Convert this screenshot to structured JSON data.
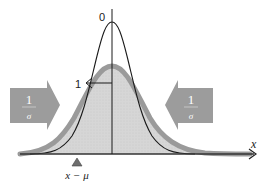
{
  "diagram": {
    "type": "normal-distribution-standardization",
    "labels": {
      "peak_label": "0",
      "sigma_point_label": "1",
      "x_axis_label": "x",
      "marker_label": "x − μ"
    },
    "left_block_arrow": {
      "numerator": "1",
      "denominator": "σ",
      "direction": "right"
    },
    "right_block_arrow": {
      "numerator": "1",
      "denominator": "σ",
      "direction": "left"
    },
    "curves": [
      {
        "name": "original-distribution",
        "style": "wide gray filled with thick gray outline"
      },
      {
        "name": "standardized-distribution",
        "style": "narrow black line"
      }
    ],
    "colors": {
      "fill": "#d4d4d4",
      "outline": "#9a9a9a",
      "block_arrow": "#9c9c9c",
      "line": "#1a1a1a",
      "marker": "#6e6e6e"
    }
  }
}
